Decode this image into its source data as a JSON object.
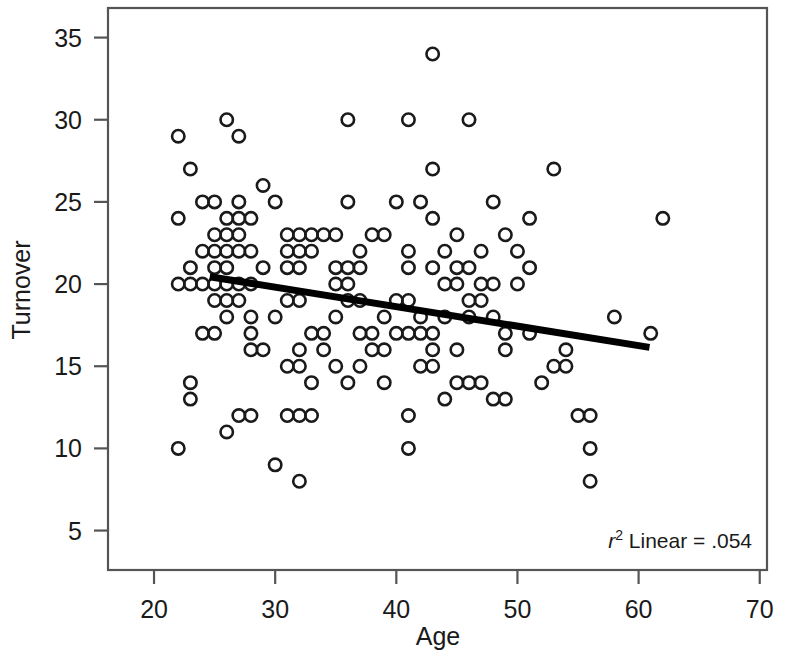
{
  "chart_data": {
    "type": "scatter",
    "title": "",
    "xlabel": "Age",
    "ylabel": "Turnover",
    "xlim": [
      16.2,
      70.6
    ],
    "ylim": [
      2.6,
      36.8
    ],
    "xticks": [
      20,
      30,
      40,
      50,
      60,
      70
    ],
    "yticks": [
      5,
      10,
      15,
      20,
      25,
      30,
      35
    ],
    "xtick_labels": [
      "20",
      "30",
      "40",
      "50",
      "60",
      "70"
    ],
    "ytick_labels": [
      "5",
      "10",
      "15",
      "20",
      "25",
      "30",
      "35"
    ],
    "grid": false,
    "legend": null,
    "marker": "open-circle",
    "marker_color": "#1a1a1a",
    "annotations": [
      {
        "name": "r-squared-annotation",
        "prefix_italic": "r",
        "superscript": "2",
        "text": " Linear = .054",
        "full_text": "r2 Linear = .054",
        "x": 57.5,
        "y": 5.2
      }
    ],
    "fit_line": {
      "name": "linear-regression-line",
      "type": "linear",
      "r_squared": 0.054,
      "x_start": 24.6,
      "y_start": 20.45,
      "x_end": 60.9,
      "y_end": 16.15
    },
    "points": [
      [
        22,
        29
      ],
      [
        23,
        27
      ],
      [
        26,
        30
      ],
      [
        27,
        29
      ],
      [
        36,
        30
      ],
      [
        41,
        30
      ],
      [
        43,
        34
      ],
      [
        46,
        30
      ],
      [
        43,
        27
      ],
      [
        53,
        27
      ],
      [
        29,
        26
      ],
      [
        24,
        25
      ],
      [
        25,
        25
      ],
      [
        27,
        25
      ],
      [
        30,
        25
      ],
      [
        36,
        25
      ],
      [
        40,
        25
      ],
      [
        42,
        25
      ],
      [
        48,
        25
      ],
      [
        62,
        24
      ],
      [
        22,
        24
      ],
      [
        26,
        24
      ],
      [
        27,
        24
      ],
      [
        28,
        24
      ],
      [
        43,
        24
      ],
      [
        51,
        24
      ],
      [
        25,
        23
      ],
      [
        26,
        23
      ],
      [
        27,
        23
      ],
      [
        31,
        23
      ],
      [
        32,
        23
      ],
      [
        33,
        23
      ],
      [
        34,
        23
      ],
      [
        35,
        23
      ],
      [
        38,
        23
      ],
      [
        39,
        23
      ],
      [
        45,
        23
      ],
      [
        49,
        23
      ],
      [
        24,
        22
      ],
      [
        25,
        22
      ],
      [
        26,
        22
      ],
      [
        27,
        22
      ],
      [
        28,
        22
      ],
      [
        31,
        22
      ],
      [
        32,
        22
      ],
      [
        33,
        22
      ],
      [
        37,
        22
      ],
      [
        41,
        22
      ],
      [
        44,
        22
      ],
      [
        47,
        22
      ],
      [
        50,
        22
      ],
      [
        23,
        21
      ],
      [
        25,
        21
      ],
      [
        26,
        21
      ],
      [
        29,
        21
      ],
      [
        31,
        21
      ],
      [
        32,
        21
      ],
      [
        35,
        21
      ],
      [
        36,
        21
      ],
      [
        37,
        21
      ],
      [
        41,
        21
      ],
      [
        43,
        21
      ],
      [
        45,
        21
      ],
      [
        46,
        21
      ],
      [
        51,
        21
      ],
      [
        22,
        20
      ],
      [
        23,
        20
      ],
      [
        24,
        20
      ],
      [
        25,
        20
      ],
      [
        26,
        20
      ],
      [
        27,
        20
      ],
      [
        28,
        20
      ],
      [
        35,
        20
      ],
      [
        36,
        20
      ],
      [
        44,
        20
      ],
      [
        45,
        20
      ],
      [
        47,
        20
      ],
      [
        48,
        20
      ],
      [
        50,
        20
      ],
      [
        25,
        19
      ],
      [
        26,
        19
      ],
      [
        27,
        19
      ],
      [
        31,
        19
      ],
      [
        32,
        19
      ],
      [
        36,
        19
      ],
      [
        37,
        19
      ],
      [
        40,
        19
      ],
      [
        41,
        19
      ],
      [
        46,
        19
      ],
      [
        47,
        19
      ],
      [
        26,
        18
      ],
      [
        28,
        18
      ],
      [
        30,
        18
      ],
      [
        35,
        18
      ],
      [
        39,
        18
      ],
      [
        42,
        18
      ],
      [
        44,
        18
      ],
      [
        46,
        18
      ],
      [
        48,
        18
      ],
      [
        58,
        18
      ],
      [
        24,
        17
      ],
      [
        25,
        17
      ],
      [
        28,
        17
      ],
      [
        33,
        17
      ],
      [
        34,
        17
      ],
      [
        37,
        17
      ],
      [
        38,
        17
      ],
      [
        40,
        17
      ],
      [
        41,
        17
      ],
      [
        42,
        17
      ],
      [
        43,
        17
      ],
      [
        49,
        17
      ],
      [
        51,
        17
      ],
      [
        61,
        17
      ],
      [
        28,
        16
      ],
      [
        29,
        16
      ],
      [
        32,
        16
      ],
      [
        34,
        16
      ],
      [
        38,
        16
      ],
      [
        39,
        16
      ],
      [
        43,
        16
      ],
      [
        45,
        16
      ],
      [
        49,
        16
      ],
      [
        54,
        16
      ],
      [
        31,
        15
      ],
      [
        32,
        15
      ],
      [
        35,
        15
      ],
      [
        37,
        15
      ],
      [
        42,
        15
      ],
      [
        43,
        15
      ],
      [
        53,
        15
      ],
      [
        54,
        15
      ],
      [
        23,
        14
      ],
      [
        33,
        14
      ],
      [
        36,
        14
      ],
      [
        39,
        14
      ],
      [
        45,
        14
      ],
      [
        46,
        14
      ],
      [
        47,
        14
      ],
      [
        52,
        14
      ],
      [
        23,
        13
      ],
      [
        44,
        13
      ],
      [
        48,
        13
      ],
      [
        49,
        13
      ],
      [
        27,
        12
      ],
      [
        28,
        12
      ],
      [
        31,
        12
      ],
      [
        32,
        12
      ],
      [
        33,
        12
      ],
      [
        41,
        12
      ],
      [
        55,
        12
      ],
      [
        56,
        12
      ],
      [
        26,
        11
      ],
      [
        22,
        10
      ],
      [
        30,
        9
      ],
      [
        41,
        10
      ],
      [
        56,
        10
      ],
      [
        32,
        8
      ],
      [
        56,
        8
      ]
    ]
  }
}
